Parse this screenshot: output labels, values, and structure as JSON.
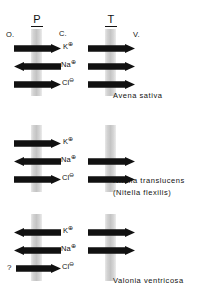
{
  "figure": {
    "headers": {
      "plasmalemma": "P",
      "tonoplast": "T"
    },
    "compartments": {
      "outside": "O.",
      "cytoplasm": "C.",
      "vacuole": "V."
    },
    "ions": {
      "potassium": "K",
      "potassium_charge": "⊕",
      "sodium": "Na",
      "sodium_charge": "⊕",
      "chloride": "Cl",
      "chloride_charge": "⊖"
    },
    "uncertain_marker": "?",
    "groups": [
      {
        "id": "avena",
        "species_line1": "Avena sativa",
        "species_line2": "",
        "rows": [
          {
            "ion": "potassium",
            "plasmalemma": "right",
            "tonoplast": "right"
          },
          {
            "ion": "sodium",
            "plasmalemma": "left",
            "tonoplast": "right"
          },
          {
            "ion": "chloride",
            "plasmalemma": "right",
            "tonoplast": "right"
          }
        ]
      },
      {
        "id": "nitella",
        "species_line1": "Nitella translucens",
        "species_line2": "(Nitella flexilis)",
        "rows": [
          {
            "ion": "potassium",
            "plasmalemma": "right",
            "tonoplast": "none"
          },
          {
            "ion": "sodium",
            "plasmalemma": "left",
            "tonoplast": "right"
          },
          {
            "ion": "chloride",
            "plasmalemma": "right",
            "tonoplast": "right"
          }
        ]
      },
      {
        "id": "valonia",
        "species_line1": "Valonia ventricosa",
        "species_line2": "",
        "rows": [
          {
            "ion": "potassium",
            "plasmalemma": "left",
            "tonoplast": "right"
          },
          {
            "ion": "sodium",
            "plasmalemma": "left",
            "tonoplast": "right"
          },
          {
            "ion": "chloride",
            "plasmalemma": "right",
            "tonoplast": "none",
            "uncertain": true
          }
        ]
      }
    ],
    "colors": {
      "arrow": "#111111",
      "membrane": "#cfcfcf",
      "text": "#111111",
      "background": "#ffffff"
    }
  }
}
